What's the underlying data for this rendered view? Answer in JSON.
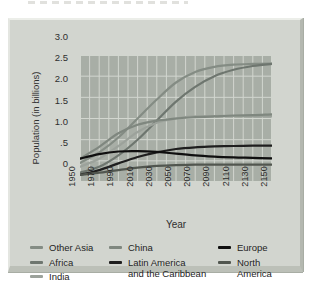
{
  "panel": {
    "bg": "#d2d5cf",
    "plot_bg": "#a8aea6",
    "grid_color": "#d2d6cf"
  },
  "chart_data": {
    "type": "line",
    "title": "",
    "xlabel": "Year",
    "ylabel": "Population (in billions)",
    "xlim": [
      1950,
      2150
    ],
    "ylim": [
      0,
      3.0
    ],
    "x_grid_step": 10,
    "grid": true,
    "legend_position": "bottom",
    "x": [
      1950,
      1970,
      1990,
      2010,
      2030,
      2050,
      2070,
      2090,
      2110,
      2130,
      2150
    ],
    "xtick_labels": [
      "1950",
      "1970",
      "1990",
      "2010",
      "2030",
      "2050",
      "2070",
      "2090",
      "2110",
      "2130",
      "2150"
    ],
    "yticks": [
      0,
      0.5,
      1.0,
      1.5,
      2.0,
      2.5,
      3.0
    ],
    "ytick_labels": [
      "0",
      ".5",
      "1.0",
      "1.5",
      "2.0",
      "2.5",
      "3.0"
    ],
    "series": [
      {
        "name": "Other Asia",
        "color": "#848c84",
        "values": [
          0.45,
          0.7,
          1.05,
          1.5,
          1.95,
          2.35,
          2.6,
          2.72,
          2.77,
          2.79,
          2.8
        ]
      },
      {
        "name": "Africa",
        "color": "#6e766f",
        "values": [
          0.22,
          0.36,
          0.63,
          1.0,
          1.45,
          1.9,
          2.25,
          2.5,
          2.65,
          2.74,
          2.79
        ]
      },
      {
        "name": "India",
        "color": "#9ca29b",
        "values": [
          0.36,
          0.55,
          0.85,
          1.18,
          1.4,
          1.5,
          1.55,
          1.56,
          1.56,
          1.55,
          1.55
        ]
      },
      {
        "name": "China",
        "color": "#7f877f",
        "values": [
          0.55,
          0.83,
          1.15,
          1.35,
          1.45,
          1.5,
          1.53,
          1.55,
          1.57,
          1.58,
          1.6
        ]
      },
      {
        "name": "Latin America and the Caribbean",
        "color": "#1e1e1e",
        "values": [
          0.17,
          0.28,
          0.44,
          0.59,
          0.7,
          0.78,
          0.82,
          0.84,
          0.85,
          0.86,
          0.86
        ]
      },
      {
        "name": "Europe",
        "color": "#0f0f0f",
        "values": [
          0.55,
          0.66,
          0.72,
          0.73,
          0.71,
          0.67,
          0.63,
          0.6,
          0.58,
          0.57,
          0.56
        ]
      },
      {
        "name": "North America",
        "color": "#51564f",
        "values": [
          0.17,
          0.22,
          0.28,
          0.34,
          0.38,
          0.4,
          0.41,
          0.41,
          0.41,
          0.41,
          0.41
        ]
      }
    ],
    "legend_columns": [
      {
        "x": 28,
        "items": [
          {
            "series": "Other Asia",
            "lines": [
              "Other Asia"
            ]
          },
          {
            "series": "Africa",
            "lines": [
              "Africa"
            ]
          },
          {
            "series": "India",
            "lines": [
              "India"
            ]
          }
        ]
      },
      {
        "x": 107,
        "items": [
          {
            "series": "China",
            "lines": [
              "China"
            ]
          },
          {
            "series": "Latin America and the Caribbean",
            "lines": [
              "Latin America",
              "and the Caribbean"
            ]
          }
        ]
      },
      {
        "x": 216,
        "items": [
          {
            "series": "Europe",
            "lines": [
              "Europe"
            ]
          },
          {
            "series": "North America",
            "lines": [
              "North",
              "America"
            ]
          }
        ]
      }
    ]
  }
}
